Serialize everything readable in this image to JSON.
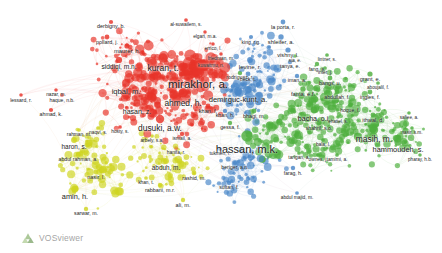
{
  "app": {
    "title": "VOSviewer network visualization",
    "brand": "VOSviewer",
    "brand_icon": "vosviewer-triangles-icon",
    "background_color": "#ffffff",
    "width": 442,
    "height": 253
  },
  "chart_data": {
    "type": "scatter",
    "title": "",
    "xlabel": "",
    "ylabel": "",
    "grid": false,
    "legend": "none",
    "clusters": [
      {
        "id": 1,
        "color": "#e8332a",
        "name": "red-cluster"
      },
      {
        "id": 2,
        "color": "#cfd420",
        "name": "yellow-cluster"
      },
      {
        "id": 3,
        "color": "#4a87c8",
        "name": "blue-cluster"
      },
      {
        "id": 4,
        "color": "#4eaf3e",
        "name": "green-cluster"
      }
    ],
    "labeled_nodes": [
      {
        "label": "mirakhor, a.",
        "x": 198,
        "y": 72,
        "size": 11.5,
        "cluster": 1,
        "font": 11.5
      },
      {
        "label": "kuran, t.",
        "x": 163,
        "y": 58,
        "size": 9,
        "cluster": 1,
        "font": 8.6
      },
      {
        "label": "ahmed, h.",
        "x": 183,
        "y": 93,
        "size": 8.5,
        "cluster": 1,
        "font": 8.4
      },
      {
        "label": "dusuki, a.w.",
        "x": 160,
        "y": 119,
        "size": 8,
        "cluster": 1,
        "font": 8.4
      },
      {
        "label": "iqbal, m.",
        "x": 126,
        "y": 83,
        "size": 7.5,
        "cluster": 1,
        "font": 7.6
      },
      {
        "label": "hasan, z.",
        "x": 137,
        "y": 103,
        "size": 7,
        "cluster": 1,
        "font": 7
      },
      {
        "label": "siddiqi, m.n.",
        "x": 119,
        "y": 60,
        "size": 6,
        "cluster": 1,
        "font": 6.6
      },
      {
        "label": "maurer, h.",
        "x": 127,
        "y": 46,
        "size": 5,
        "cluster": 1,
        "font": 5.8
      },
      {
        "label": "pollard, j.",
        "x": 107,
        "y": 37,
        "size": 4.6,
        "cluster": 1,
        "font": 5.4
      },
      {
        "label": "derbigny, b.",
        "x": 111,
        "y": 22,
        "size": 4,
        "cluster": 1,
        "font": 5.4
      },
      {
        "label": "al-suwailem, s.",
        "x": 186,
        "y": 20,
        "size": 3.6,
        "cluster": 1,
        "font": 4.8
      },
      {
        "label": "elgari, m.a.",
        "x": 205,
        "y": 32,
        "size": 3.4,
        "cluster": 1,
        "font": 4.8
      },
      {
        "label": "errico, l.",
        "x": 213,
        "y": 44,
        "size": 3.4,
        "cluster": 1,
        "font": 4.8
      },
      {
        "label": "friedman, m.",
        "x": 221,
        "y": 54,
        "size": 3.4,
        "cluster": 1,
        "font": 4.8
      },
      {
        "label": "kuwaitmu, n.",
        "x": 211,
        "y": 62,
        "size": 3,
        "cluster": 1,
        "font": 4.6
      },
      {
        "label": "khan, f.",
        "x": 208,
        "y": 106,
        "size": 4.6,
        "cluster": 1,
        "font": 5.6
      },
      {
        "label": "lessard, r.",
        "x": 21,
        "y": 95,
        "size": 3.4,
        "cluster": 1,
        "font": 5
      },
      {
        "label": "haque, n.b.",
        "x": 62,
        "y": 95,
        "size": 3.6,
        "cluster": 1,
        "font": 5
      },
      {
        "label": "ahmad, k.",
        "x": 51,
        "y": 110,
        "size": 4,
        "cluster": 1,
        "font": 5.2
      },
      {
        "label": "nazar, m.",
        "x": 56,
        "y": 90,
        "size": 3.4,
        "cluster": 1,
        "font": 4.8
      },
      {
        "label": "rahman, m.",
        "x": 79,
        "y": 130,
        "size": 3.6,
        "cluster": 2,
        "font": 4.8
      },
      {
        "label": "naqvi, s.",
        "x": 98,
        "y": 128,
        "size": 3.6,
        "cluster": 2,
        "font": 4.8
      },
      {
        "label": "hosty, s.",
        "x": 120,
        "y": 127,
        "size": 3.6,
        "cluster": 1,
        "font": 4.8
      },
      {
        "label": "haron, s.",
        "x": 74,
        "y": 140,
        "size": 5.6,
        "cluster": 2,
        "font": 6.4
      },
      {
        "label": "abdul rahman, a.",
        "x": 78,
        "y": 155,
        "size": 4.2,
        "cluster": 2,
        "font": 5.2
      },
      {
        "label": "nasir, l.",
        "x": 96,
        "y": 172,
        "size": 4.6,
        "cluster": 2,
        "font": 5.6
      },
      {
        "label": "amin, h.",
        "x": 75,
        "y": 189,
        "size": 6.5,
        "cluster": 2,
        "font": 7.4
      },
      {
        "label": "sarwar, m.",
        "x": 86,
        "y": 209,
        "size": 4.2,
        "cluster": 2,
        "font": 5.2
      },
      {
        "label": "abduh, m.",
        "x": 166,
        "y": 161,
        "size": 5.6,
        "cluster": 2,
        "font": 6.4
      },
      {
        "label": "rashid, m.",
        "x": 194,
        "y": 173,
        "size": 4.6,
        "cluster": 2,
        "font": 5.4
      },
      {
        "label": "rabbani, m.r.",
        "x": 160,
        "y": 185,
        "size": 4.2,
        "cluster": 2,
        "font": 5.4
      },
      {
        "label": "ali, m.",
        "x": 183,
        "y": 200,
        "size": 4.2,
        "cluster": 2,
        "font": 5.6
      },
      {
        "label": "khan, t.",
        "x": 146,
        "y": 178,
        "size": 3.6,
        "cluster": 2,
        "font": 4.8
      },
      {
        "label": "hanifa, r.",
        "x": 176,
        "y": 148,
        "size": 3.6,
        "cluster": 1,
        "font": 4.8
      },
      {
        "label": "arbely, s.a.",
        "x": 152,
        "y": 136,
        "size": 3.6,
        "cluster": 2,
        "font": 4.8
      },
      {
        "label": "ismail, a.",
        "x": 182,
        "y": 134,
        "size": 4.2,
        "cluster": 1,
        "font": 4.8
      },
      {
        "label": "hassan, m.k.",
        "x": 247,
        "y": 136,
        "size": 11,
        "cluster": 4,
        "font": 11
      },
      {
        "label": "demirguc-kunt, a.",
        "x": 238,
        "y": 91,
        "size": 7.6,
        "cluster": 3,
        "font": 7.6
      },
      {
        "label": "rodriguez, r.",
        "x": 240,
        "y": 73,
        "size": 4.2,
        "cluster": 4,
        "font": 5.2
      },
      {
        "label": "khan, h.",
        "x": 225,
        "y": 111,
        "size": 4.2,
        "cluster": 3,
        "font": 5.2
      },
      {
        "label": "bhagi, m.",
        "x": 254,
        "y": 111,
        "size": 4.6,
        "cluster": 4,
        "font": 5.4
      },
      {
        "label": "gessa, f.",
        "x": 230,
        "y": 123,
        "size": 4.2,
        "cluster": 4,
        "font": 5.2
      },
      {
        "label": "la porta, r.",
        "x": 283,
        "y": 22,
        "size": 4.6,
        "cluster": 3,
        "font": 5.4
      },
      {
        "label": "shleifer, a.",
        "x": 281,
        "y": 37,
        "size": 5.2,
        "cluster": 3,
        "font": 5.8
      },
      {
        "label": "king, r.g.",
        "x": 251,
        "y": 37,
        "size": 4,
        "cluster": 3,
        "font": 5
      },
      {
        "label": "vishny, l.",
        "x": 288,
        "y": 50,
        "size": 5,
        "cluster": 3,
        "font": 5.6
      },
      {
        "label": "levine, r.",
        "x": 250,
        "y": 60,
        "size": 5.6,
        "cluster": 3,
        "font": 6
      },
      {
        "label": "tanya, e.",
        "x": 290,
        "y": 62,
        "size": 4.2,
        "cluster": 3,
        "font": 5.2
      },
      {
        "label": "beck, t.",
        "x": 248,
        "y": 74,
        "size": 4.6,
        "cluster": 3,
        "font": 5
      },
      {
        "label": "iman, a.",
        "x": 297,
        "y": 76,
        "size": 4.2,
        "cluster": 3,
        "font": 5.2
      },
      {
        "label": "fang, a.",
        "x": 317,
        "y": 64,
        "size": 4.2,
        "cluster": 4,
        "font": 5
      },
      {
        "label": "lintner, s.",
        "x": 327,
        "y": 55,
        "size": 3.6,
        "cluster": 4,
        "font": 4.6
      },
      {
        "label": "sia, e.",
        "x": 295,
        "y": 56,
        "size": 3.4,
        "cluster": 4,
        "font": 4.6
      },
      {
        "label": "inter, j.",
        "x": 325,
        "y": 68,
        "size": 3.6,
        "cluster": 4,
        "font": 4.8
      },
      {
        "label": "bangs, u.",
        "x": 330,
        "y": 78,
        "size": 4.6,
        "cluster": 4,
        "font": 5.4
      },
      {
        "label": "grant, e.",
        "x": 370,
        "y": 74,
        "size": 5,
        "cluster": 4,
        "font": 5.6
      },
      {
        "label": "fama, e.f.",
        "x": 303,
        "y": 89,
        "size": 5.2,
        "cluster": 4,
        "font": 5.8
      },
      {
        "label": "abdullah, f.",
        "x": 337,
        "y": 92,
        "size": 4.6,
        "cluster": 4,
        "font": 5.2
      },
      {
        "label": "ingles, f.",
        "x": 370,
        "y": 92,
        "size": 4.6,
        "cluster": 4,
        "font": 5.4
      },
      {
        "label": "aboujalil, f.",
        "x": 378,
        "y": 83,
        "size": 3.6,
        "cluster": 4,
        "font": 4.6
      },
      {
        "label": "bacha, o.i.",
        "x": 314,
        "y": 110,
        "size": 6.5,
        "cluster": 4,
        "font": 7
      },
      {
        "label": "hoque, f.",
        "x": 350,
        "y": 105,
        "size": 4.2,
        "cluster": 4,
        "font": 5
      },
      {
        "label": "shahril, s.o.",
        "x": 319,
        "y": 123,
        "size": 4.6,
        "cluster": 4,
        "font": 5.2
      },
      {
        "label": "ithwal, d.",
        "x": 373,
        "y": 115,
        "size": 4.6,
        "cluster": 4,
        "font": 5.4
      },
      {
        "label": "safiee, a.",
        "x": 409,
        "y": 113,
        "size": 3.4,
        "cluster": 4,
        "font": 4.6
      },
      {
        "label": "ehatiel, s.",
        "x": 338,
        "y": 117,
        "size": 3.4,
        "cluster": 4,
        "font": 4.6
      },
      {
        "label": "masih, m.",
        "x": 374,
        "y": 130,
        "size": 8,
        "cluster": 4,
        "font": 8.4
      },
      {
        "label": "hammoudeh, s.",
        "x": 398,
        "y": 142,
        "size": 7,
        "cluster": 4,
        "font": 7.4
      },
      {
        "label": "bala, l.",
        "x": 323,
        "y": 140,
        "size": 3.6,
        "cluster": 4,
        "font": 4.8
      },
      {
        "label": "nasir, s.m.",
        "x": 412,
        "y": 128,
        "size": 3.4,
        "cluster": 4,
        "font": 4.6
      },
      {
        "label": "pharay, h.b.",
        "x": 420,
        "y": 155,
        "size": 3.4,
        "cluster": 4,
        "font": 4.6
      },
      {
        "label": "ownes, j.",
        "x": 318,
        "y": 155,
        "size": 3.6,
        "cluster": 4,
        "font": 4.8
      },
      {
        "label": "tarigan, a.",
        "x": 299,
        "y": 153,
        "size": 3.6,
        "cluster": 4,
        "font": 4.8
      },
      {
        "label": "tamimi, a.",
        "x": 337,
        "y": 155,
        "size": 3.6,
        "cluster": 4,
        "font": 4.8
      },
      {
        "label": "beriger, a.n.",
        "x": 235,
        "y": 163,
        "size": 4.2,
        "cluster": 3,
        "font": 5.2
      },
      {
        "label": "farag, h.",
        "x": 293,
        "y": 168,
        "size": 4.2,
        "cluster": 3,
        "font": 5
      },
      {
        "label": "sultan, f.",
        "x": 229,
        "y": 183,
        "size": 4.2,
        "cluster": 3,
        "font": 5.2
      },
      {
        "label": "abdul majid, m.",
        "x": 297,
        "y": 193,
        "size": 3.6,
        "cluster": 3,
        "font": 4.8
      },
      {
        "label": "tukmen, f.",
        "x": 220,
        "y": 149,
        "size": 3.6,
        "cluster": 3,
        "font": 4.8
      }
    ]
  }
}
